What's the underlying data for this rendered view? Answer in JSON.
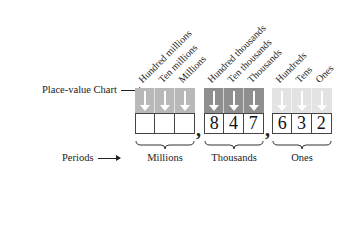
{
  "row_labels": {
    "chart": "Place-value Chart",
    "periods": "Periods"
  },
  "groups": [
    {
      "period": "Millions",
      "color": "#b9b9b9",
      "columns": [
        "Hundred millions",
        "Ten millions",
        "Millions"
      ],
      "digits": [
        "",
        "",
        ""
      ]
    },
    {
      "period": "Thousands",
      "color": "#8f8f8f",
      "columns": [
        "Hundred thousands",
        "Ten thousands",
        "Thousands"
      ],
      "digits": [
        "8",
        "4",
        "7"
      ]
    },
    {
      "period": "Ones",
      "color": "#e3e3e3",
      "columns": [
        "Hundreds",
        "Tens",
        "Ones"
      ],
      "digits": [
        "6",
        "3",
        "2"
      ]
    }
  ],
  "separators": [
    ",",
    ","
  ],
  "number_shown": "847,632"
}
